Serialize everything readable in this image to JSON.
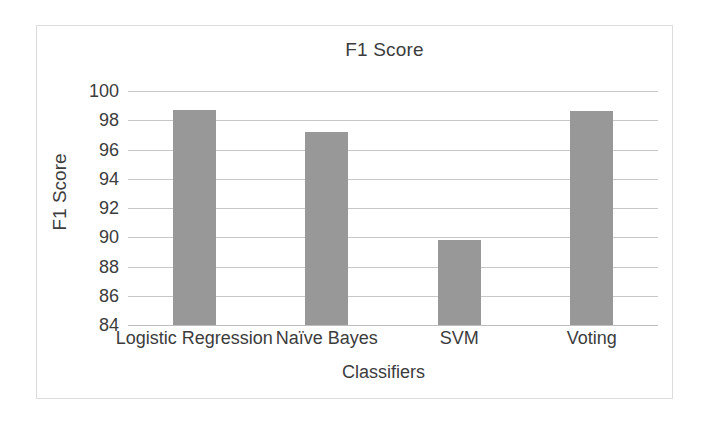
{
  "chart_data": {
    "type": "bar",
    "title": "F1 Score",
    "xlabel": "Classifiers",
    "ylabel": "F1 Score",
    "categories": [
      "Logistic Regression",
      "Naïve Bayes",
      "SVM",
      "Voting"
    ],
    "values": [
      98.7,
      97.2,
      89.8,
      98.6
    ],
    "ylim": [
      84,
      100
    ],
    "ytick_labels": [
      "84",
      "86",
      "88",
      "90",
      "92",
      "94",
      "96",
      "98",
      "100"
    ],
    "ytick_values": [
      84,
      86,
      88,
      90,
      92,
      94,
      96,
      98,
      100
    ],
    "grid": true,
    "legend": false,
    "bar_color": "#989898",
    "gridline_color": "#c8c8c8",
    "text_color": "#3c3c3c",
    "border_color": "#dcdcdc",
    "background": "#ffffff"
  }
}
